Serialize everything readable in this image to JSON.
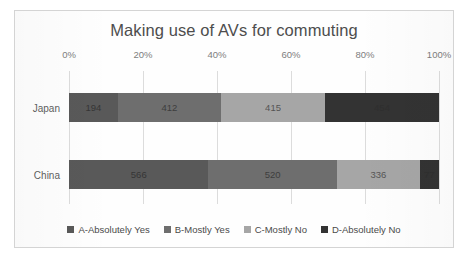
{
  "chart_data": {
    "type": "bar",
    "orientation": "horizontal",
    "stacked": true,
    "normalized": true,
    "title": "Making use of AVs for commuting",
    "xlabel": "",
    "ylabel": "",
    "categories": [
      "Japan",
      "China"
    ],
    "xlim": [
      0,
      100
    ],
    "xticks": [
      0,
      20,
      40,
      60,
      80,
      100
    ],
    "xtick_labels": [
      "0%",
      "20%",
      "40%",
      "60%",
      "80%",
      "100%"
    ],
    "grid": true,
    "legend_position": "bottom",
    "series": [
      {
        "name": "A-Absolutely Yes",
        "color": "#595959",
        "values": [
          194,
          566
        ],
        "percents": [
          13.2,
          37.7
        ]
      },
      {
        "name": "B-Mostly Yes",
        "color": "#6e6e6e",
        "values": [
          412,
          520
        ],
        "percents": [
          27.9,
          34.7
        ]
      },
      {
        "name": "C-Mostly No",
        "color": "#a6a6a6",
        "values": [
          415,
          336
        ],
        "percents": [
          28.1,
          22.4
        ]
      },
      {
        "name": "D-Absolutely No",
        "color": "#333333",
        "values": [
          454,
          77
        ],
        "percents": [
          30.8,
          5.1
        ]
      }
    ],
    "totals": [
      1475,
      1499
    ]
  },
  "legend": {
    "items": [
      {
        "label": "A-Absolutely Yes",
        "color": "#595959"
      },
      {
        "label": "B-Mostly Yes",
        "color": "#6e6e6e"
      },
      {
        "label": "C-Mostly No",
        "color": "#a6a6a6"
      },
      {
        "label": "D-Absolutely No",
        "color": "#333333"
      }
    ]
  }
}
